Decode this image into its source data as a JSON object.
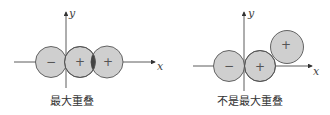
{
  "colors": {
    "orbital_fill": "#cfcfcf",
    "orbital_stroke": "#555555",
    "overlap_fill": "#444444",
    "axis": "#333333"
  },
  "diagrams": [
    {
      "caption": "最大重叠",
      "axes": {
        "x_label": "x",
        "y_label": "y"
      },
      "orbitals": [
        {
          "sign": "−"
        },
        {
          "sign": "+"
        },
        {
          "sign": "+"
        }
      ]
    },
    {
      "caption": "不是最大重叠",
      "axes": {
        "x_label": "x",
        "y_label": "y"
      },
      "orbitals": [
        {
          "sign": "−"
        },
        {
          "sign": "+"
        },
        {
          "sign": "+"
        }
      ]
    }
  ]
}
